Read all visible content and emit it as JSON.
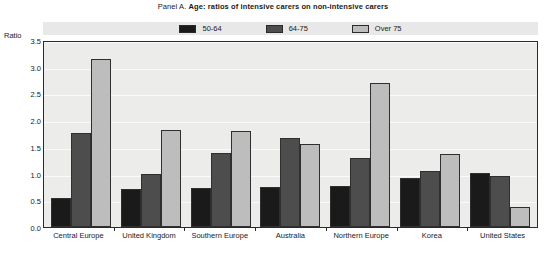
{
  "title": {
    "prefix": "Panel A.",
    "main": "Age: ratios of intensive carers on non-intensive carers",
    "full": "Panel A. Age: ratios of intensive carers on non-intensive carers"
  },
  "axis": {
    "y_title": "Ratio"
  },
  "colors": {
    "series_50_64": "#1a1a1a",
    "series_64_75": "#4d4d4d",
    "series_over_75": "#bdbdbd",
    "plot_background": "#ececeb",
    "legend_background": "#e8e8e8",
    "axis_line": "#2a2a2a"
  },
  "chart_data": {
    "type": "bar",
    "title": "Panel A. Age: ratios of intensive carers on non-intensive carers",
    "xlabel": "",
    "ylabel": "Ratio",
    "ylim": [
      0,
      3.5
    ],
    "yticks": [
      "0.0",
      "0.5",
      "1.0",
      "1.5",
      "2.0",
      "2.5",
      "3.0",
      "3.5"
    ],
    "ytick_values": [
      0,
      0.5,
      1.0,
      1.5,
      2.0,
      2.5,
      3.0,
      3.5
    ],
    "grid": true,
    "legend_position": "top",
    "categories": [
      "Central Europe",
      "United Kingdom",
      "Southern Europe",
      "Australia",
      "Northern Europe",
      "Korea",
      "United States"
    ],
    "series": [
      {
        "name": "50-64",
        "color": "#1a1a1a",
        "values": [
          0.55,
          0.72,
          0.73,
          0.75,
          0.77,
          0.92,
          1.02
        ]
      },
      {
        "name": "64-75",
        "color": "#4d4d4d",
        "values": [
          1.76,
          1.0,
          1.39,
          1.67,
          1.3,
          1.04,
          0.96
        ]
      },
      {
        "name": "Over 75",
        "color": "#bdbdbd",
        "values": [
          3.15,
          1.82,
          1.79,
          1.56,
          2.7,
          1.36,
          0.37
        ]
      }
    ]
  }
}
